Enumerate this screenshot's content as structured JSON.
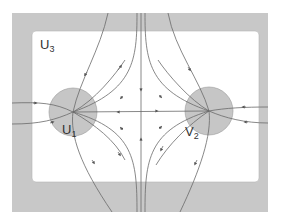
{
  "diagram": {
    "type": "phase-portrait",
    "regions": {
      "outer": {
        "label": "U",
        "sub": "3"
      },
      "left_disk": {
        "label": "U",
        "sub": "1"
      },
      "right_disk": {
        "label": "V",
        "sub": "2"
      }
    },
    "colors": {
      "frame": "#c8c8c8",
      "disk": "#c6c6c6",
      "line": "#6a6a6a",
      "background": "#ffffff"
    }
  }
}
